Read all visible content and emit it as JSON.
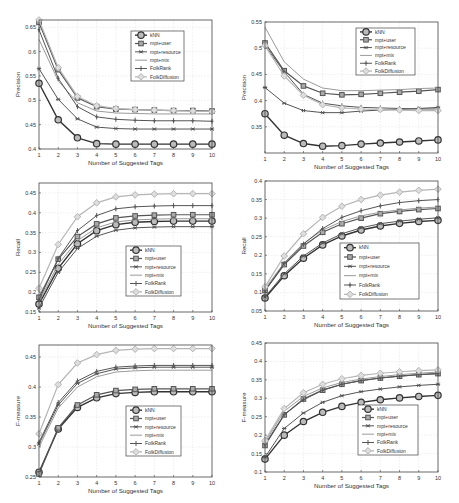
{
  "figure": {
    "xlabel": "Number of Suggested Tags",
    "series_names": [
      "kNN",
      "mpt+user",
      "mpt+resource",
      "mpt+mix",
      "FolkRank",
      "FolkDiffusion"
    ],
    "series_styles": [
      {
        "color": "#333333",
        "marker": "circle-big",
        "width": 1.4
      },
      {
        "color": "#555555",
        "marker": "square",
        "width": 1.2
      },
      {
        "color": "#555555",
        "marker": "star",
        "width": 1.0
      },
      {
        "color": "#9a9a9a",
        "marker": "none",
        "width": 1.0
      },
      {
        "color": "#555555",
        "marker": "plus",
        "width": 1.0
      },
      {
        "color": "#b5b5b5",
        "marker": "diamond",
        "width": 1.2
      }
    ]
  },
  "chart_data": [
    {
      "type": "line",
      "title": "",
      "xlabel": "Number of Suggested Tags",
      "ylabel": "Precision",
      "x": [
        1,
        2,
        3,
        4,
        5,
        6,
        7,
        8,
        9,
        10
      ],
      "ylim": [
        0.4,
        0.665
      ],
      "yticks": [
        0.4,
        0.45,
        0.5,
        0.55,
        0.6,
        0.65
      ],
      "ytick_labels": [
        "0.4",
        "0.45",
        "0.5",
        "0.55",
        "0.6",
        "0.65"
      ],
      "grid": true,
      "legend_position": "upper right",
      "box": {
        "x0": 39,
        "y0": 20,
        "x1": 212,
        "y1": 149
      },
      "legend": {
        "x": 131,
        "y": 31,
        "w": 53,
        "h": 50
      },
      "series": [
        {
          "name": "kNN",
          "values": [
            0.535,
            0.46,
            0.423,
            0.411,
            0.41,
            0.41,
            0.41,
            0.41,
            0.41,
            0.41
          ]
        },
        {
          "name": "mpt+user",
          "values": [
            0.66,
            0.563,
            0.505,
            0.487,
            0.482,
            0.481,
            0.48,
            0.479,
            0.479,
            0.478
          ]
        },
        {
          "name": "mpt+resource",
          "values": [
            0.565,
            0.502,
            0.462,
            0.445,
            0.442,
            0.441,
            0.441,
            0.441,
            0.441,
            0.441
          ]
        },
        {
          "name": "mpt+mix",
          "values": [
            0.625,
            0.54,
            0.495,
            0.478,
            0.474,
            0.473,
            0.472,
            0.472,
            0.472,
            0.472
          ]
        },
        {
          "name": "FolkRank",
          "values": [
            0.645,
            0.545,
            0.487,
            0.466,
            0.461,
            0.459,
            0.458,
            0.458,
            0.458,
            0.457
          ]
        },
        {
          "name": "FolkDiffusion",
          "values": [
            0.665,
            0.567,
            0.508,
            0.489,
            0.483,
            0.481,
            0.48,
            0.479,
            0.478,
            0.477
          ]
        }
      ]
    },
    {
      "type": "line",
      "title": "",
      "xlabel": "Number of Suggested Tags",
      "ylabel": "Precision",
      "x": [
        1,
        2,
        3,
        4,
        5,
        6,
        7,
        8,
        9,
        10
      ],
      "ylim": [
        0.3,
        0.55
      ],
      "yticks": [
        0.35,
        0.4,
        0.45,
        0.5,
        0.55
      ],
      "ytick_labels": [
        "0.35",
        "0.4",
        "0.45",
        "0.5",
        "0.55"
      ],
      "grid": true,
      "legend_position": "upper right",
      "box": {
        "x0": 265,
        "y0": 22,
        "x1": 438,
        "y1": 153
      },
      "legend": {
        "x": 356,
        "y": 28,
        "w": 59,
        "h": 47
      },
      "series": [
        {
          "name": "kNN",
          "values": [
            0.375,
            0.334,
            0.318,
            0.313,
            0.314,
            0.317,
            0.319,
            0.321,
            0.323,
            0.325
          ]
        },
        {
          "name": "mpt+user",
          "values": [
            0.51,
            0.457,
            0.428,
            0.414,
            0.411,
            0.412,
            0.414,
            0.416,
            0.418,
            0.421
          ]
        },
        {
          "name": "mpt+resource",
          "values": [
            0.425,
            0.395,
            0.381,
            0.377,
            0.377,
            0.38,
            0.382,
            0.383,
            0.385,
            0.387
          ]
        },
        {
          "name": "mpt+mix",
          "values": [
            0.54,
            0.474,
            0.441,
            0.424,
            0.419,
            0.419,
            0.42,
            0.421,
            0.423,
            0.424
          ]
        },
        {
          "name": "FolkRank",
          "values": [
            0.505,
            0.455,
            0.412,
            0.395,
            0.39,
            0.387,
            0.386,
            0.385,
            0.384,
            0.384
          ]
        },
        {
          "name": "FolkDiffusion",
          "values": [
            0.505,
            0.447,
            0.41,
            0.392,
            0.386,
            0.384,
            0.383,
            0.382,
            0.381,
            0.381
          ]
        }
      ]
    },
    {
      "type": "line",
      "title": "",
      "xlabel": "Number of Suggested Tags",
      "ylabel": "Recall",
      "x": [
        1,
        2,
        3,
        4,
        5,
        6,
        7,
        8,
        9,
        10
      ],
      "ylim": [
        0.15,
        0.475
      ],
      "yticks": [
        0.15,
        0.2,
        0.25,
        0.3,
        0.35,
        0.4,
        0.45
      ],
      "ytick_labels": [
        "0.15",
        "0.2",
        "0.25",
        "0.3",
        "0.35",
        "0.4",
        "0.45"
      ],
      "grid": true,
      "legend_position": "lower right",
      "box": {
        "x0": 39,
        "y0": 183,
        "x1": 212,
        "y1": 312
      },
      "legend": {
        "x": 126,
        "y": 246,
        "w": 55,
        "h": 50
      },
      "series": [
        {
          "name": "kNN",
          "values": [
            0.17,
            0.26,
            0.322,
            0.355,
            0.37,
            0.376,
            0.378,
            0.379,
            0.379,
            0.379
          ]
        },
        {
          "name": "mpt+user",
          "values": [
            0.187,
            0.283,
            0.34,
            0.372,
            0.387,
            0.392,
            0.394,
            0.395,
            0.395,
            0.395
          ]
        },
        {
          "name": "mpt+resource",
          "values": [
            0.16,
            0.25,
            0.31,
            0.341,
            0.356,
            0.362,
            0.364,
            0.365,
            0.365,
            0.365
          ]
        },
        {
          "name": "mpt+mix",
          "values": [
            0.176,
            0.27,
            0.33,
            0.362,
            0.377,
            0.382,
            0.384,
            0.385,
            0.385,
            0.385
          ]
        },
        {
          "name": "FolkRank",
          "values": [
            0.18,
            0.285,
            0.355,
            0.393,
            0.41,
            0.415,
            0.417,
            0.418,
            0.418,
            0.418
          ]
        },
        {
          "name": "FolkDiffusion",
          "values": [
            0.21,
            0.32,
            0.39,
            0.425,
            0.44,
            0.445,
            0.447,
            0.448,
            0.448,
            0.448
          ]
        }
      ]
    },
    {
      "type": "line",
      "title": "",
      "xlabel": "Number of Suggested Tags",
      "ylabel": "Recall",
      "x": [
        1,
        2,
        3,
        4,
        5,
        6,
        7,
        8,
        9,
        10
      ],
      "ylim": [
        0.05,
        0.4
      ],
      "yticks": [
        0.05,
        0.1,
        0.15,
        0.2,
        0.25,
        0.3,
        0.35,
        0.4
      ],
      "ytick_labels": [
        "0.05",
        "0.1",
        "0.15",
        "0.2",
        "0.25",
        "0.3",
        "0.35",
        "0.4"
      ],
      "grid": true,
      "legend_position": "lower right",
      "box": {
        "x0": 265,
        "y0": 181,
        "x1": 438,
        "y1": 311
      },
      "legend": {
        "x": 340,
        "y": 243,
        "w": 79,
        "h": 56
      },
      "series": [
        {
          "name": "kNN",
          "values": [
            0.085,
            0.145,
            0.192,
            0.228,
            0.252,
            0.268,
            0.279,
            0.286,
            0.291,
            0.294
          ]
        },
        {
          "name": "mpt+user",
          "values": [
            0.105,
            0.175,
            0.225,
            0.262,
            0.285,
            0.3,
            0.312,
            0.318,
            0.323,
            0.326
          ]
        },
        {
          "name": "mpt+resource",
          "values": [
            0.088,
            0.15,
            0.198,
            0.233,
            0.258,
            0.274,
            0.285,
            0.292,
            0.297,
            0.301
          ]
        },
        {
          "name": "mpt+mix",
          "values": [
            0.11,
            0.18,
            0.232,
            0.268,
            0.291,
            0.306,
            0.316,
            0.322,
            0.327,
            0.33
          ]
        },
        {
          "name": "FolkRank",
          "values": [
            0.105,
            0.178,
            0.23,
            0.272,
            0.302,
            0.32,
            0.333,
            0.342,
            0.347,
            0.35
          ]
        },
        {
          "name": "FolkDiffusion",
          "values": [
            0.115,
            0.198,
            0.258,
            0.302,
            0.332,
            0.35,
            0.362,
            0.37,
            0.375,
            0.378
          ]
        }
      ]
    },
    {
      "type": "line",
      "title": "",
      "xlabel": "Number of Suggested Tags",
      "ylabel": "F-measure",
      "x": [
        1,
        2,
        3,
        4,
        5,
        6,
        7,
        8,
        9,
        10
      ],
      "ylim": [
        0.25,
        0.47
      ],
      "yticks": [
        0.25,
        0.3,
        0.35,
        0.4,
        0.45
      ],
      "ytick_labels": [
        "0.25",
        "0.3",
        "0.35",
        "0.4",
        "0.45"
      ],
      "grid": true,
      "legend_position": "lower right",
      "box": {
        "x0": 39,
        "y0": 345,
        "x1": 212,
        "y1": 477
      },
      "legend": {
        "x": 126,
        "y": 406,
        "w": 55,
        "h": 50
      },
      "series": [
        {
          "name": "kNN",
          "values": [
            0.258,
            0.33,
            0.366,
            0.382,
            0.389,
            0.391,
            0.392,
            0.392,
            0.392,
            0.392
          ]
        },
        {
          "name": "mpt+user",
          "values": [
            0.255,
            0.332,
            0.37,
            0.387,
            0.394,
            0.396,
            0.397,
            0.397,
            0.397,
            0.397
          ]
        },
        {
          "name": "mpt+resource",
          "values": [
            0.305,
            0.37,
            0.406,
            0.422,
            0.43,
            0.432,
            0.433,
            0.433,
            0.433,
            0.433
          ]
        },
        {
          "name": "mpt+mix",
          "values": [
            0.3,
            0.365,
            0.4,
            0.417,
            0.425,
            0.427,
            0.428,
            0.428,
            0.428,
            0.428
          ]
        },
        {
          "name": "FolkRank",
          "values": [
            0.308,
            0.374,
            0.41,
            0.426,
            0.433,
            0.435,
            0.436,
            0.436,
            0.436,
            0.436
          ]
        },
        {
          "name": "FolkDiffusion",
          "values": [
            0.322,
            0.404,
            0.44,
            0.454,
            0.461,
            0.463,
            0.464,
            0.464,
            0.464,
            0.464
          ]
        }
      ]
    },
    {
      "type": "line",
      "title": "",
      "xlabel": "Number of Suggested Tags",
      "ylabel": "F-measure",
      "x": [
        1,
        2,
        3,
        4,
        5,
        6,
        7,
        8,
        9,
        10
      ],
      "ylim": [
        0.1,
        0.45
      ],
      "yticks": [
        0.1,
        0.15,
        0.2,
        0.25,
        0.3,
        0.35,
        0.4,
        0.45
      ],
      "ytick_labels": [
        "0.1",
        "0.15",
        "0.2",
        "0.25",
        "0.3",
        "0.35",
        "0.4",
        "0.45"
      ],
      "grid": true,
      "legend_position": "lower right",
      "box": {
        "x0": 265,
        "y0": 343,
        "x1": 438,
        "y1": 472
      },
      "legend": {
        "x": 358,
        "y": 405,
        "w": 60,
        "h": 50
      },
      "series": [
        {
          "name": "kNN",
          "values": [
            0.135,
            0.2,
            0.237,
            0.262,
            0.278,
            0.289,
            0.296,
            0.301,
            0.305,
            0.308
          ]
        },
        {
          "name": "mpt+user",
          "values": [
            0.172,
            0.255,
            0.298,
            0.322,
            0.338,
            0.348,
            0.355,
            0.36,
            0.364,
            0.367
          ]
        },
        {
          "name": "mpt+resource",
          "values": [
            0.14,
            0.218,
            0.26,
            0.289,
            0.307,
            0.318,
            0.325,
            0.331,
            0.335,
            0.338
          ]
        },
        {
          "name": "mpt+mix",
          "values": [
            0.18,
            0.265,
            0.305,
            0.328,
            0.343,
            0.352,
            0.359,
            0.364,
            0.368,
            0.371
          ]
        },
        {
          "name": "FolkRank",
          "values": [
            0.175,
            0.256,
            0.296,
            0.322,
            0.338,
            0.348,
            0.355,
            0.36,
            0.364,
            0.367
          ]
        },
        {
          "name": "FolkDiffusion",
          "values": [
            0.185,
            0.272,
            0.315,
            0.338,
            0.353,
            0.362,
            0.368,
            0.372,
            0.375,
            0.377
          ]
        }
      ]
    }
  ]
}
